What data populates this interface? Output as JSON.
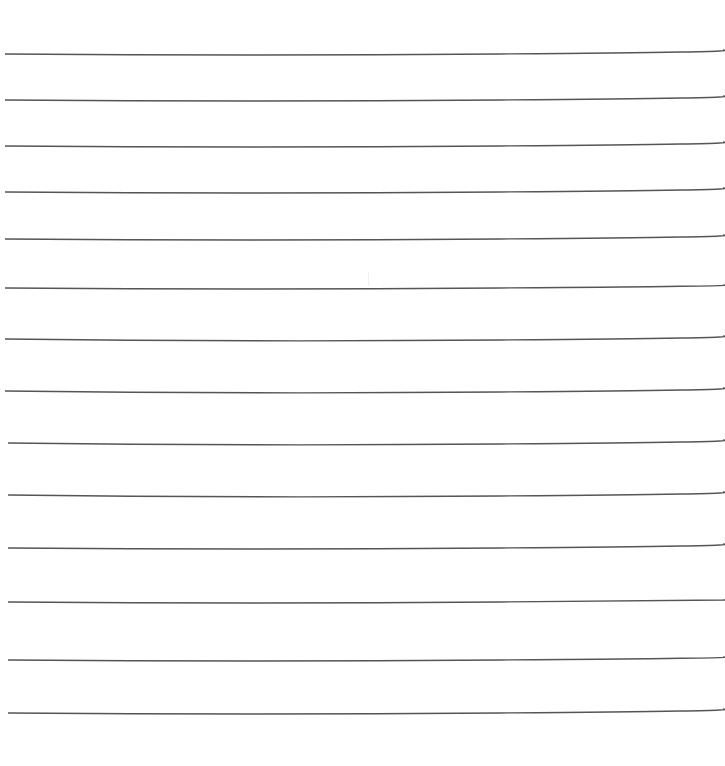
{
  "document": {
    "type": "lined-paper",
    "line_count": 14,
    "line_color": "#555555",
    "background": "#ffffff"
  }
}
